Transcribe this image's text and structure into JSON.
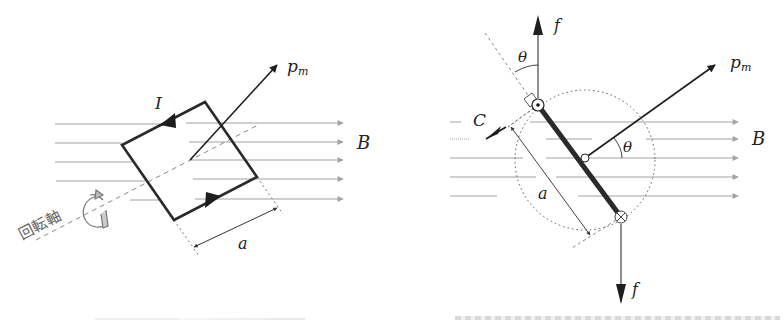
{
  "figure_left": {
    "title": "Rectangular current loop in uniform magnetic field (perspective view)",
    "labels": {
      "moment": "p",
      "moment_sub": "m",
      "current": "I",
      "field": "B",
      "side": "a",
      "axis": "回転軸"
    },
    "field_lines_y": [
      124,
      143,
      161,
      180,
      200
    ],
    "colors": {
      "loop": "#2a2a2a",
      "field": "#9a9a9a",
      "axis": "#8a8a8a"
    }
  },
  "figure_right": {
    "title": "Side view of loop: forces and torque",
    "labels": {
      "force_top": "f",
      "force_bottom": "f",
      "moment": "p",
      "moment_sub": "m",
      "angle_top": "θ",
      "angle_center": "θ",
      "torque": "C",
      "field": "B",
      "side": "a",
      "current_out_symbol": "⊙",
      "current_in_symbol": "⊗"
    },
    "field_lines_y": [
      122,
      139,
      158,
      176,
      196
    ],
    "colors": {
      "bar": "#2a2a2a",
      "field": "#9a9a9a"
    }
  },
  "captions": {
    "left": "",
    "right": ""
  }
}
